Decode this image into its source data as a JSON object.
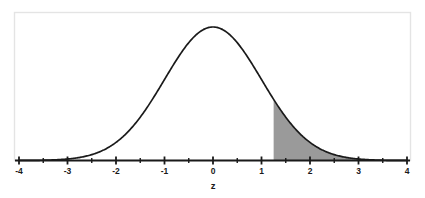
{
  "chart_data": {
    "type": "area",
    "title": "",
    "subtitle": "",
    "xlabel": "z",
    "ylabel": "",
    "xlim": [
      -4,
      4
    ],
    "ylim": [
      0,
      0.4
    ],
    "grid": false,
    "legend": null,
    "curve": {
      "name": "standard normal density",
      "distribution": "normal",
      "mean": 0,
      "sd": 1,
      "peak_value": 0.3989,
      "line_color": "#1a1a1a",
      "line_width": 1.6
    },
    "shaded_region": {
      "name": "right tail",
      "from": 1.25,
      "to": 4,
      "fill_color": "#9a9a9a",
      "note": "upper tail area shaded grey"
    },
    "x_major_ticks": [
      -4,
      -3,
      -2,
      -1,
      0,
      1,
      2,
      3,
      4
    ],
    "x_minor_ticks": [
      -3.5,
      -2.5,
      -1.5,
      -0.5,
      0.5,
      1.5,
      2.5,
      3.5
    ],
    "x_tick_labels": [
      "-4",
      "-3",
      "-2",
      "-1",
      "0",
      "1",
      "2",
      "3",
      "4"
    ],
    "axis_color": "#1a1a1a",
    "frame_color": "#e4e4e4",
    "background_color": "#ffffff"
  },
  "axis": {
    "title": "z",
    "labels": {
      "n4": "-4",
      "n3": "-3",
      "n2": "-2",
      "n1": "-1",
      "z0": "0",
      "p1": "1",
      "p2": "2",
      "p3": "3",
      "p4": "4"
    }
  }
}
